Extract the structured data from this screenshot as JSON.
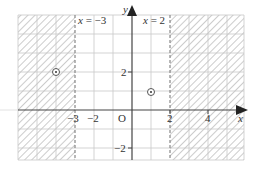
{
  "diagram": {
    "type": "coordinate-plane-shaded-regions",
    "axes": {
      "x_label": "x",
      "y_label": "y",
      "origin_label": "O"
    },
    "x_ticks": [
      {
        "value": -3,
        "label": "−3"
      },
      {
        "value": -2,
        "label": "−2"
      },
      {
        "value": 2,
        "label": "2"
      },
      {
        "value": 4,
        "label": "4"
      }
    ],
    "y_ticks": [
      {
        "value": 2,
        "label": "2"
      },
      {
        "value": -2,
        "label": "−2"
      }
    ],
    "boundary_lines": [
      {
        "equation": "x = −3",
        "x": -3,
        "style": "dashed"
      },
      {
        "equation": "x = 2",
        "x": 2,
        "style": "dashed"
      }
    ],
    "shaded_regions": [
      {
        "description": "x < -3",
        "pattern": "hatched"
      },
      {
        "description": "x > 2",
        "pattern": "hatched"
      }
    ],
    "points": [
      {
        "x": -5,
        "y": 2,
        "marker": "circled-dot"
      },
      {
        "x": 1,
        "y": 0.5,
        "marker": "circled-dot"
      }
    ],
    "colors": {
      "grid": "#c8c8c8",
      "axis": "#333333",
      "hatch": "#b0b0b0",
      "dashed": "#888888"
    }
  }
}
